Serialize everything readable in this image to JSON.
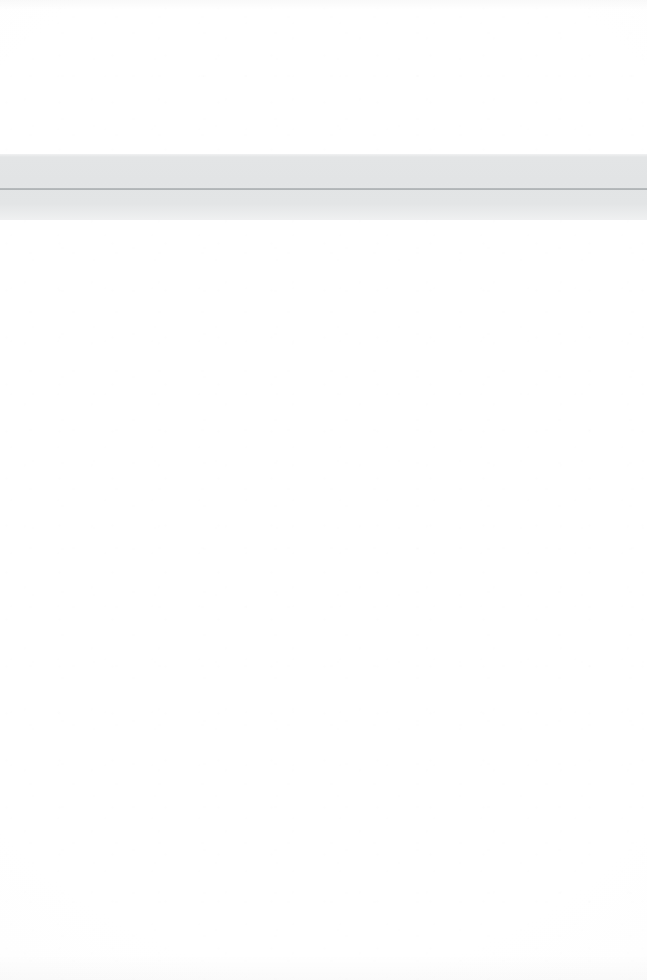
{
  "page": {
    "kind": "scanned-blank-document-page",
    "width_px": 647,
    "height_px": 980,
    "background_color": "#ffffff",
    "visible_text": "",
    "has_text": false,
    "has_icons": false,
    "has_images": false
  },
  "regions": {
    "upper_blank": {
      "label": "",
      "top_px": 0,
      "height_px": 154,
      "color": "#ffffff"
    },
    "lower_blank": {
      "label": "",
      "top_px": 220,
      "height_px": 760,
      "color": "#ffffff"
    }
  },
  "band": {
    "label": "",
    "top_px": 154,
    "height_px": 66,
    "fill_color": "#e3e5e6",
    "rule": {
      "label": "",
      "top_px": 188,
      "height_px": 2,
      "color": "#aeb2b4"
    }
  }
}
